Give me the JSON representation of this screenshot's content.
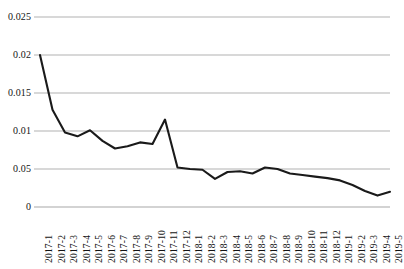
{
  "chart_data": {
    "type": "line",
    "title": "",
    "subtitle": "",
    "xlabel": "",
    "ylabel": "",
    "grid": true,
    "legend": false,
    "legend_position": "none",
    "line_color": "#1a1a1a",
    "grid_color": "#a8a8a8",
    "background": "#ffffff",
    "ylim": [
      0,
      0.025
    ],
    "ytick_labels": [
      "0.025",
      "0.02",
      "0.015",
      "0.01",
      "0.05",
      "0"
    ],
    "ytick_values": [
      0.025,
      0.02,
      0.015,
      0.01,
      0.005,
      0
    ],
    "categories": [
      "2017-1",
      "2017-2",
      "2017-3",
      "2017-4",
      "2017-5",
      "2017-6",
      "2017-7",
      "2017-8",
      "2017-9",
      "2017-10",
      "2017-11",
      "2017-12",
      "2018-1",
      "2018-2",
      "2018-3",
      "2018-4",
      "2018-5",
      "2018-6",
      "2018-7",
      "2018-8",
      "2018-9",
      "2018-10",
      "2018-11",
      "2018-12",
      "2019-1",
      "2019-2",
      "2019-3",
      "2019-4",
      "2019-5"
    ],
    "values": [
      0.02,
      0.0128,
      0.0098,
      0.0093,
      0.0101,
      0.0087,
      0.0077,
      0.008,
      0.0085,
      0.0083,
      0.0115,
      0.0052,
      0.005,
      0.0049,
      0.0037,
      0.0046,
      0.0047,
      0.0044,
      0.0052,
      0.005,
      0.0044,
      0.0042,
      0.004,
      0.0038,
      0.0035,
      0.0029,
      0.0021,
      0.0015,
      0.002
    ]
  }
}
